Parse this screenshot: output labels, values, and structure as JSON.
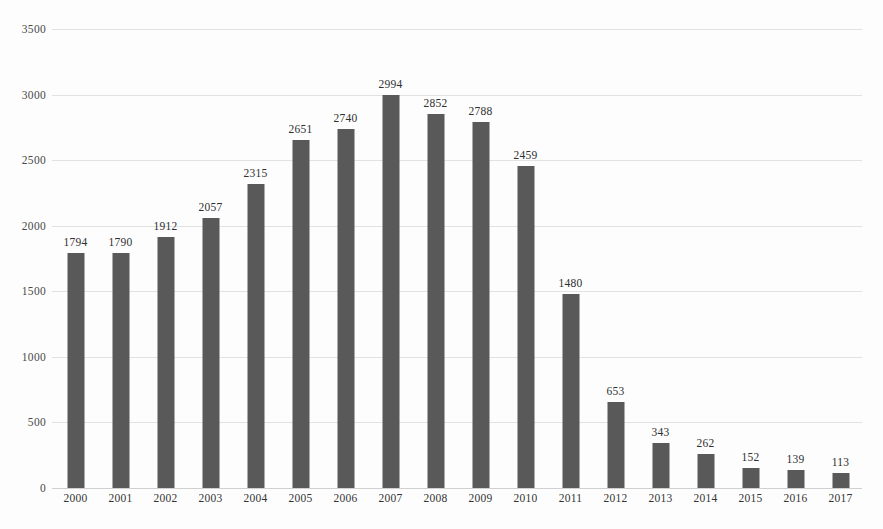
{
  "chart_data": {
    "type": "bar",
    "title": "",
    "subtitle": "",
    "xlabel": "",
    "ylabel": "",
    "categories": [
      "2000",
      "2001",
      "2002",
      "2003",
      "2004",
      "2005",
      "2006",
      "2007",
      "2008",
      "2009",
      "2010",
      "2011",
      "2012",
      "2013",
      "2014",
      "2015",
      "2016",
      "2017"
    ],
    "values": [
      1794,
      1790,
      1912,
      2057,
      2315,
      2651,
      2740,
      2994,
      2852,
      2788,
      2459,
      1480,
      653,
      343,
      262,
      152,
      139,
      113
    ],
    "data_labels": [
      "1794",
      "1790",
      "1912",
      "2057",
      "2315",
      "2651",
      "2740",
      "2994",
      "2852",
      "2788",
      "2459",
      "1480",
      "653",
      "343",
      "262",
      "152",
      "139",
      "113"
    ],
    "ylim": [
      0,
      3500
    ],
    "yticks": [
      3500,
      3000,
      2500,
      2000,
      1500,
      1000,
      500,
      0
    ],
    "ytick_labels": [
      "3500",
      "3000",
      "2500",
      "2000",
      "1500",
      "1000",
      "500",
      "0"
    ],
    "grid": true,
    "legend": false,
    "legend_position": "none",
    "bar_color": "#595959",
    "gridline_color": "#e2e2e2",
    "background_color": "#fdfdfd",
    "text_color": "#2f2f2f"
  }
}
